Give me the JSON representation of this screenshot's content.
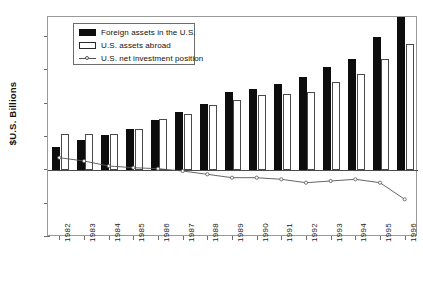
{
  "chart_data": {
    "type": "bar",
    "title": "",
    "xlabel": "",
    "ylabel": "$U.S. Billions",
    "categories": [
      "1982",
      "1983",
      "1984",
      "1985",
      "1986",
      "1987",
      "1988",
      "1989",
      "1990",
      "1991",
      "1992",
      "1993",
      "1994",
      "1995",
      "1996"
    ],
    "ylim": [
      -2000,
      4600
    ],
    "yticks": [
      4000,
      3000,
      2000,
      1000,
      0,
      -1000,
      -2000
    ],
    "ytick_labels": [
      "$4,000",
      "$3,000",
      "$2,000",
      "$1,000",
      "$0",
      "-$1,000",
      "-$2,000"
    ],
    "grid": false,
    "legend_position": "upper left",
    "series": [
      {
        "name": "Foreign assets in the U.S.",
        "type": "bar",
        "color": "#0d0d0d",
        "values": [
          700,
          900,
          1050,
          1250,
          1500,
          1750,
          2000,
          2350,
          2450,
          2600,
          2800,
          3100,
          3350,
          4000,
          4600
        ]
      },
      {
        "name": "U.S. assets abroad",
        "type": "bar",
        "color": "#ffffff",
        "values": [
          1100,
          1100,
          1100,
          1250,
          1550,
          1700,
          1950,
          2100,
          2250,
          2300,
          2350,
          2650,
          2900,
          3350,
          3800
        ]
      },
      {
        "name": "U.S. net investment position",
        "type": "line",
        "color": "#555555",
        "values": [
          350,
          250,
          100,
          50,
          20,
          -50,
          -150,
          -250,
          -250,
          -300,
          -400,
          -350,
          -300,
          -400,
          -900
        ]
      }
    ]
  },
  "legend": {
    "items": [
      {
        "label": "Foreign assets in the U.S.",
        "marker": "black-square"
      },
      {
        "label": "U.S. assets abroad",
        "marker": "white-square"
      },
      {
        "label": "U.S. net investment position",
        "marker": "line-with-marker"
      }
    ]
  }
}
